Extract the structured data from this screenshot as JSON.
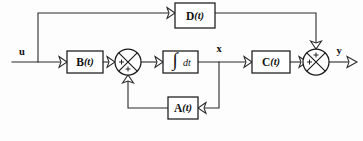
{
  "diagram": {
    "type": "control-system-block-diagram",
    "background_color": "#fdfdfd",
    "line_color": "#2a2a2a",
    "box_fill": "#ffffff",
    "box_stroke": "#1a1a1a",
    "signals": {
      "input": "u",
      "state": "x",
      "output": "y"
    },
    "blocks": [
      {
        "id": "d-block",
        "name": "D",
        "argument": "(t)",
        "label": "D(t)",
        "role": "feedthrough-gain",
        "x": 175,
        "y": 3,
        "w": 40,
        "h": 25
      },
      {
        "id": "b-block",
        "name": "B",
        "argument": "(t)",
        "label": "B(t)",
        "role": "input-gain",
        "x": 67,
        "y": 51,
        "w": 36,
        "h": 22
      },
      {
        "id": "integrator-block",
        "name": "∫",
        "argument": "dt",
        "label": "∫dt",
        "role": "integrator",
        "x": 163,
        "y": 51,
        "w": 35,
        "h": 22
      },
      {
        "id": "c-block",
        "name": "C",
        "argument": "(t)",
        "label": "C(t)",
        "role": "output-gain",
        "x": 252,
        "y": 51,
        "w": 38,
        "h": 22
      },
      {
        "id": "a-block",
        "name": "A",
        "argument": "(t)",
        "label": "A(t)",
        "role": "state-feedback-gain",
        "x": 168,
        "y": 97,
        "w": 30,
        "h": 22
      }
    ],
    "summing_junctions": [
      {
        "id": "left-sum",
        "cx": 128,
        "cy": 62,
        "r": 13,
        "signs": [
          {
            "position": "left",
            "symbol": "+"
          },
          {
            "position": "bottom",
            "symbol": "+"
          }
        ]
      },
      {
        "id": "right-sum",
        "cx": 316,
        "cy": 62,
        "r": 13,
        "signs": [
          {
            "position": "top",
            "symbol": "+"
          },
          {
            "position": "left",
            "symbol": "+"
          }
        ]
      }
    ],
    "labels": [
      {
        "id": "u-label",
        "text": "u",
        "x": 22,
        "y": 53
      },
      {
        "id": "x-label",
        "text": "x",
        "x": 219,
        "y": 50
      },
      {
        "id": "y-label",
        "text": "y",
        "x": 339,
        "y": 52
      }
    ]
  }
}
